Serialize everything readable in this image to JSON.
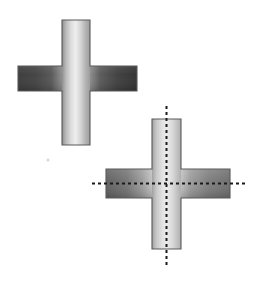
{
  "document": {
    "title": "Cross (Plus) Shape Figures",
    "background_color": "#ffffff",
    "width": 257,
    "height": 284,
    "description": "Two shaded plus-shaped (cruciform) solids; the lower-right one is annotated with dashed horizontal and vertical centerlines."
  },
  "figures": [
    {
      "id": "figure-upper-left",
      "name": "upper-left-cross",
      "label": "",
      "has_centerlines": false,
      "geometry": {
        "vertical_bar": {
          "x": 62,
          "y": 20,
          "width": 28,
          "height": 125
        },
        "horizontal_bar": {
          "x": 18,
          "y": 66,
          "width": 119,
          "height": 25
        },
        "center": {
          "x": 76,
          "y": 78.5
        }
      },
      "style": {
        "outline_color": "#5a5a5a",
        "outline_width": 1,
        "vertical_gradient": [
          "#8e8e8e",
          "#d8d8d8",
          "#eeeeee",
          "#c8c8c8",
          "#a6a6a6"
        ],
        "horizontal_gradient": [
          "#3a3a3a",
          "#4a4a4a",
          "#bdbdbd",
          "#4a4a4a",
          "#333333"
        ]
      }
    },
    {
      "id": "figure-lower-right",
      "name": "lower-right-cross",
      "label": "",
      "has_centerlines": true,
      "geometry": {
        "vertical_bar": {
          "x": 152,
          "y": 119,
          "width": 29,
          "height": 130
        },
        "horizontal_bar": {
          "x": 106,
          "y": 169,
          "width": 124,
          "height": 29
        },
        "center": {
          "x": 166.5,
          "y": 183.5
        }
      },
      "style": {
        "outline_color": "#5a5a5a",
        "outline_width": 1,
        "vertical_gradient": [
          "#9a9a9a",
          "#d5d5d5",
          "#eaeaea",
          "#d0d0d0",
          "#b4b4b4"
        ],
        "horizontal_gradient": [
          "#5e5e5e",
          "#6e6e6e",
          "#c4c4c4",
          "#8c8c8c",
          "#6a6a6a"
        ]
      },
      "centerlines": {
        "color": "#1a1a1a",
        "width": 2,
        "dash_pattern": "3 3",
        "vertical": {
          "x": 166.5,
          "y1": 106,
          "y2": 268
        },
        "horizontal": {
          "y": 183.5,
          "x1": 92,
          "x2": 247
        }
      }
    }
  ],
  "artifacts": [
    {
      "name": "speck-mark",
      "x": 48,
      "y": 160,
      "radius": 1.6,
      "color": "#d8d8d8"
    }
  ]
}
